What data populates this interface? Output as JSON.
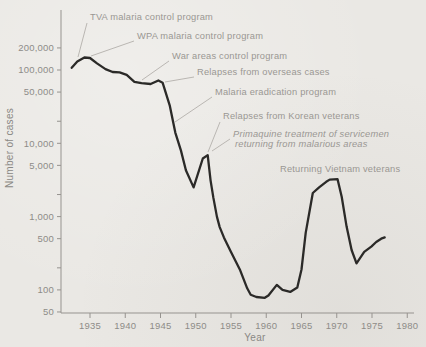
{
  "figure": {
    "bg_color": "#eae8e4",
    "curve_color": "#2b2a28",
    "axis_color": "#96938f",
    "leader_color": "#b3b0ab",
    "text_color": "#8e8c88"
  },
  "chart_data": {
    "type": "line",
    "title": "",
    "xlabel": "Year",
    "ylabel": "Number of cases",
    "xlim": [
      1931,
      1981
    ],
    "ylim": [
      50,
      500000
    ],
    "y_scale": "log",
    "grid": false,
    "x_axis": {
      "label": "Year",
      "ticks": [
        1935,
        1940,
        1945,
        1950,
        1955,
        1960,
        1965,
        1970,
        1975,
        1980
      ]
    },
    "y_axis": {
      "label": "Number of cases",
      "scale": "log",
      "ticks": [
        {
          "value": 200000,
          "label": "200,000"
        },
        {
          "value": 100000,
          "label": "100,000"
        },
        {
          "value": 50000,
          "label": "50,000"
        },
        {
          "value": 20000,
          "label": ""
        },
        {
          "value": 10000,
          "label": "10,000"
        },
        {
          "value": 5000,
          "label": "5,000"
        },
        {
          "value": 2000,
          "label": ""
        },
        {
          "value": 1000,
          "label": "1,000"
        },
        {
          "value": 500,
          "label": "500"
        },
        {
          "value": 200,
          "label": ""
        },
        {
          "value": 100,
          "label": "100"
        },
        {
          "value": 50,
          "label": "50"
        }
      ]
    },
    "series": [
      {
        "name": "reported cases",
        "points": [
          [
            1932.4,
            107000
          ],
          [
            1933.2,
            130000
          ],
          [
            1934.2,
            148000
          ],
          [
            1935.0,
            146000
          ],
          [
            1936.0,
            123000
          ],
          [
            1937.2,
            103000
          ],
          [
            1938.2,
            94000
          ],
          [
            1939.2,
            93000
          ],
          [
            1940.2,
            86000
          ],
          [
            1941.3,
            69000
          ],
          [
            1942.3,
            66000
          ],
          [
            1943.6,
            64500
          ],
          [
            1944.7,
            72000
          ],
          [
            1945.3,
            67000
          ],
          [
            1946.3,
            33000
          ],
          [
            1947.1,
            14000
          ],
          [
            1947.9,
            8000
          ],
          [
            1948.6,
            4300
          ],
          [
            1949.7,
            2500
          ],
          [
            1951.0,
            6200
          ],
          [
            1951.7,
            6900
          ],
          [
            1952.1,
            3100
          ],
          [
            1952.5,
            1800
          ],
          [
            1953.0,
            1000
          ],
          [
            1953.4,
            720
          ],
          [
            1954.0,
            520
          ],
          [
            1955.0,
            330
          ],
          [
            1956.3,
            185
          ],
          [
            1957.3,
            105
          ],
          [
            1957.8,
            86
          ],
          [
            1958.6,
            80
          ],
          [
            1959.8,
            78
          ],
          [
            1960.3,
            84
          ],
          [
            1961.5,
            117
          ],
          [
            1962.3,
            100
          ],
          [
            1963.4,
            94
          ],
          [
            1964.4,
            108
          ],
          [
            1965.0,
            190
          ],
          [
            1965.6,
            600
          ],
          [
            1966.6,
            2100
          ],
          [
            1967.5,
            2500
          ],
          [
            1968.5,
            2980
          ],
          [
            1969.0,
            3200
          ],
          [
            1970.1,
            3250
          ],
          [
            1970.7,
            1870
          ],
          [
            1971.4,
            730
          ],
          [
            1972.1,
            350
          ],
          [
            1972.8,
            230
          ],
          [
            1973.9,
            330
          ],
          [
            1974.9,
            390
          ],
          [
            1975.6,
            450
          ],
          [
            1976.3,
            500
          ],
          [
            1976.8,
            520
          ]
        ]
      }
    ],
    "annotations": [
      {
        "lines": [
          "TVA malaria control program"
        ],
        "italic": false,
        "x": 90,
        "y": 20,
        "leader": [
          87,
          23,
          78,
          57
        ]
      },
      {
        "lines": [
          "WPA malaria control program"
        ],
        "italic": false,
        "x": 137,
        "y": 39,
        "leader": [
          134,
          41,
          91,
          56
        ]
      },
      {
        "lines": [
          "War areas control program"
        ],
        "italic": false,
        "x": 172,
        "y": 59,
        "leader": [
          169,
          61,
          142,
          80
        ]
      },
      {
        "lines": [
          "Relapses from overseas cases"
        ],
        "italic": false,
        "x": 197,
        "y": 75,
        "leader": [
          194,
          77,
          165,
          82
        ]
      },
      {
        "lines": [
          "Malaria eradication program"
        ],
        "italic": false,
        "x": 215,
        "y": 95,
        "leader": [
          212,
          97,
          175,
          122
        ]
      },
      {
        "lines": [
          "Relapses from Korean veterans"
        ],
        "italic": false,
        "x": 223,
        "y": 119,
        "leader": [
          220,
          122,
          208,
          152
        ]
      },
      {
        "lines": [
          "Primaquine treatment of servicemen",
          "returning from malarious areas"
        ],
        "italic": true,
        "x": 233,
        "y": 137,
        "leader": [
          230,
          139,
          212,
          151
        ]
      },
      {
        "lines": [
          "Returning Vietnam veterans"
        ],
        "italic": false,
        "x": 280,
        "y": 172,
        "leader": null
      }
    ]
  }
}
